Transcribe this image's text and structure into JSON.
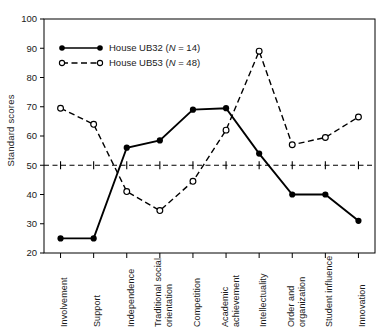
{
  "chart_data": {
    "type": "line",
    "title": "",
    "xlabel": "",
    "ylabel": "Standard scores",
    "ylim": [
      20,
      100
    ],
    "yticks": [
      20,
      30,
      40,
      50,
      60,
      70,
      80,
      90,
      100
    ],
    "grid": false,
    "legend_position": "upper-left-inside",
    "reference_line": {
      "value": 50,
      "style": "dashed",
      "label": ""
    },
    "categories": [
      "Involvement",
      "Support",
      "Independence",
      "Traditional social orientation",
      "Competition",
      "Academic achievement",
      "Intellectuality",
      "Order and organization",
      "Student influence",
      "Innovation"
    ],
    "series": [
      {
        "name": "House UB32 (N = 14)",
        "label_main": "House UB32 (",
        "label_italic": "N",
        "label_tail": " = 14)",
        "marker": "filled-circle",
        "line_style": "solid",
        "color": "#000000",
        "values": [
          25,
          25,
          56,
          58.5,
          69,
          69.5,
          54,
          40,
          40,
          31
        ]
      },
      {
        "name": "House UB53 (N = 48)",
        "label_main": "House UB53 (",
        "label_italic": "N",
        "label_tail": " = 48)",
        "marker": "open-circle",
        "line_style": "dashed",
        "color": "#000000",
        "values": [
          69.5,
          64,
          41,
          34.5,
          44.5,
          62,
          89,
          57,
          59.5,
          66.5
        ]
      }
    ]
  },
  "axis": {
    "y_tick_labels": [
      "100",
      "90",
      "80",
      "70",
      "60",
      "50",
      "40",
      "30",
      "20"
    ],
    "y_title": "Standard scores"
  },
  "legend": {
    "items": [
      {
        "text": "House UB32 (N = 14)"
      },
      {
        "text": "House UB53 (N = 48)"
      }
    ]
  }
}
